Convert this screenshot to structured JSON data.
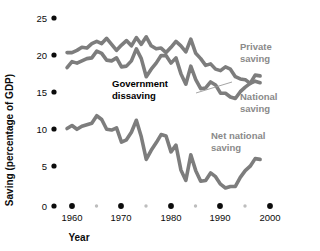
{
  "chart_data": {
    "type": "line",
    "title": "",
    "xlabel": "Year",
    "ylabel": "Saving (percentage of GDP)",
    "xlim": [
      1958,
      2000
    ],
    "ylim": [
      0,
      25
    ],
    "xticks": [
      1960,
      1970,
      1980,
      1990,
      2000
    ],
    "xtick_labels": [
      "1960",
      "1970",
      "1980",
      "1990",
      "2000"
    ],
    "xticks_minor": [
      1965,
      1975,
      1985,
      1995
    ],
    "yticks": [
      0,
      5,
      10,
      15,
      20,
      25
    ],
    "ytick_labels": [
      "0",
      "5",
      "10",
      "15",
      "20",
      "25"
    ],
    "grid": false,
    "legend": "inline-annotations",
    "line_color": "#7d7d7d",
    "series": [
      {
        "name": "Private saving",
        "label": "Private saving",
        "label_line1": "Private",
        "label_line2": "saving",
        "label_color": "#8a8a8a",
        "x": [
          1959,
          1960,
          1961,
          1962,
          1963,
          1964,
          1965,
          1966,
          1967,
          1968,
          1969,
          1970,
          1971,
          1972,
          1973,
          1974,
          1975,
          1976,
          1977,
          1978,
          1979,
          1980,
          1981,
          1982,
          1983,
          1984,
          1985,
          1986,
          1987,
          1988,
          1989,
          1990,
          1991,
          1992,
          1993,
          1994,
          1995,
          1996,
          1997,
          1998
        ],
        "values": [
          20.4,
          20.4,
          20.7,
          21.1,
          21.0,
          21.6,
          21.9,
          21.6,
          22.3,
          21.5,
          20.7,
          21.4,
          22.0,
          21.3,
          22.4,
          21.5,
          22.5,
          21.3,
          20.9,
          21.0,
          20.4,
          21.1,
          21.9,
          21.3,
          20.5,
          22.2,
          20.3,
          19.6,
          18.7,
          18.9,
          18.2,
          18.0,
          18.5,
          18.2,
          17.2,
          16.9,
          16.8,
          16.3,
          16.6,
          16.4
        ]
      },
      {
        "name": "National saving",
        "label": "National saving",
        "label_line1": "National",
        "label_line2": "saving",
        "label_color": "#8a8a8a",
        "x": [
          1959,
          1960,
          1961,
          1962,
          1963,
          1964,
          1965,
          1966,
          1967,
          1968,
          1969,
          1970,
          1971,
          1972,
          1973,
          1974,
          1975,
          1976,
          1977,
          1978,
          1979,
          1980,
          1981,
          1982,
          1983,
          1984,
          1985,
          1986,
          1987,
          1988,
          1989,
          1990,
          1991,
          1992,
          1993,
          1994,
          1995,
          1996,
          1997,
          1998
        ],
        "values": [
          18.4,
          19.2,
          19.0,
          19.3,
          19.6,
          19.7,
          20.6,
          20.3,
          19.4,
          19.3,
          19.7,
          18.5,
          18.6,
          19.3,
          20.9,
          19.6,
          17.2,
          18.2,
          19.0,
          20.0,
          20.0,
          19.0,
          19.7,
          17.6,
          16.2,
          18.6,
          16.8,
          15.6,
          15.7,
          16.5,
          16.1,
          15.0,
          15.0,
          14.5,
          14.3,
          15.2,
          15.8,
          16.3,
          17.4,
          17.3
        ]
      },
      {
        "name": "Net national saving",
        "label": "Net national saving",
        "label_line1": "Net national",
        "label_line2": "saving",
        "label_color": "#8a8a8a",
        "x": [
          1959,
          1960,
          1961,
          1962,
          1963,
          1964,
          1965,
          1966,
          1967,
          1968,
          1969,
          1970,
          1971,
          1972,
          1973,
          1974,
          1975,
          1976,
          1977,
          1978,
          1979,
          1980,
          1981,
          1982,
          1983,
          1984,
          1985,
          1986,
          1987,
          1988,
          1989,
          1990,
          1991,
          1992,
          1993,
          1994,
          1995,
          1996,
          1997,
          1998
        ],
        "values": [
          10.3,
          10.7,
          10.2,
          10.6,
          10.8,
          11.0,
          12.0,
          11.5,
          10.2,
          10.1,
          10.4,
          8.5,
          8.8,
          9.8,
          11.4,
          9.2,
          6.2,
          7.4,
          8.4,
          9.5,
          9.3,
          7.2,
          8.1,
          4.8,
          3.4,
          6.8,
          4.7,
          3.3,
          3.4,
          4.4,
          3.9,
          2.9,
          2.4,
          2.6,
          2.6,
          3.8,
          4.7,
          5.3,
          6.3,
          6.2
        ]
      }
    ],
    "annotations": [
      {
        "name": "government-dissaving",
        "text": "Government dissaving",
        "line1": "Government",
        "line2": "dissaving",
        "color": "#000000",
        "has_leader_line": true
      }
    ]
  }
}
